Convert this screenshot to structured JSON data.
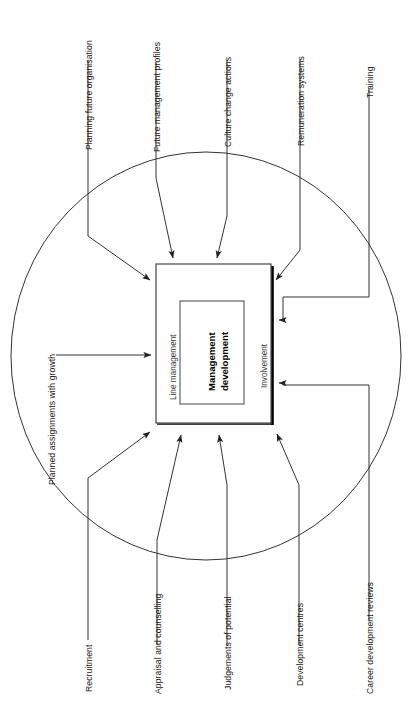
{
  "diagram": {
    "center": {
      "inner_label_line1": "Management",
      "inner_label_line2": "development",
      "left_band_label": "Line management",
      "right_band_label": "Involvement"
    },
    "boundary": {
      "shape": "ellipse",
      "stroke": "#333333",
      "fill": "none"
    },
    "inputs": [
      {
        "id": "planning-future-organisation",
        "label": "Planning future organisation",
        "side": "top"
      },
      {
        "id": "future-management-profiles",
        "label": "Future management profiles",
        "side": "top"
      },
      {
        "id": "culture-change-actions",
        "label": "Culture change actions",
        "side": "top"
      },
      {
        "id": "remuneration-systems",
        "label": "Remuneration systems",
        "side": "top"
      },
      {
        "id": "training",
        "label": "Training",
        "side": "top-right"
      },
      {
        "id": "planned-assignments-with-growth",
        "label": "Planned assignments with growth",
        "side": "left"
      },
      {
        "id": "recruitment",
        "label": "Recruitment",
        "side": "bottom"
      },
      {
        "id": "appraisal-and-counselling",
        "label": "Appraisal and counselling",
        "side": "bottom"
      },
      {
        "id": "judgements-of-potential",
        "label": "Judgements of potential",
        "side": "bottom"
      },
      {
        "id": "development-centres",
        "label": "Development centres",
        "side": "bottom"
      },
      {
        "id": "career-development-reviews",
        "label": "Career development reviews",
        "side": "bottom-right"
      }
    ],
    "colors": {
      "line": "#333333",
      "text": "#1a1a1a",
      "band_text": "#3a3a3a",
      "box_stroke": "#333333",
      "shadow": "#000000",
      "background": "#ffffff"
    }
  }
}
